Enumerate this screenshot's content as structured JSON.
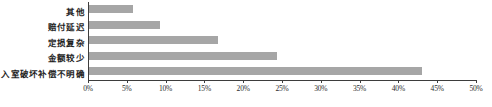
{
  "chart_data": {
    "type": "bar",
    "orientation": "horizontal",
    "title": "",
    "subtitle": "",
    "xlabel": "",
    "ylabel": "",
    "categories": [
      "其他",
      "赔付延迟",
      "定损复杂",
      "金额较少",
      "入室破坏补偿不明确"
    ],
    "values": [
      5.8,
      9.3,
      16.7,
      24.4,
      43.0
    ],
    "value_format": "percent",
    "xlim": [
      0,
      50
    ],
    "xtick_labels": [
      "0%",
      "5%",
      "10%",
      "15%",
      "20%",
      "25%",
      "30%",
      "35%",
      "40%",
      "45%",
      "50%"
    ],
    "xtick_values": [
      0,
      5,
      10,
      15,
      20,
      25,
      30,
      35,
      40,
      45,
      50
    ],
    "grid": false,
    "legend": null,
    "legend_position": "none",
    "annotations": [],
    "bar_color": "#a6a6a6",
    "axis_color": "#3d3d3d",
    "background_color": "#ffffff"
  }
}
